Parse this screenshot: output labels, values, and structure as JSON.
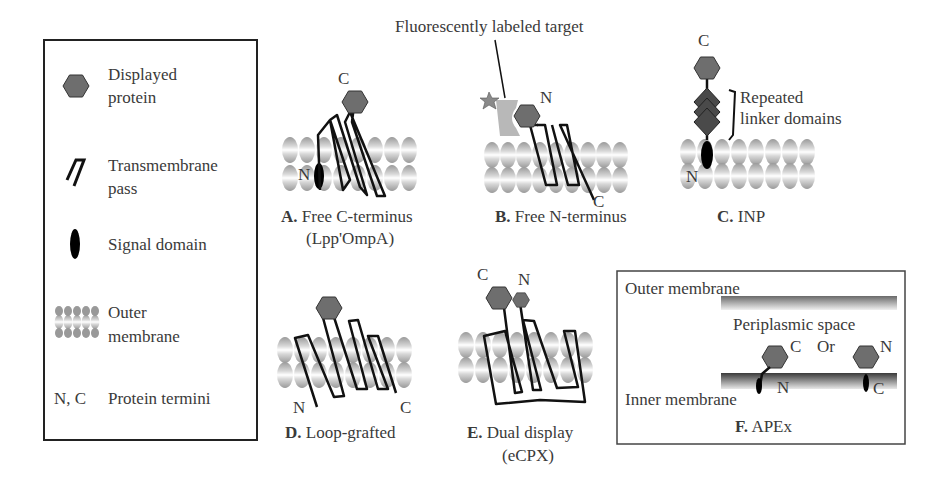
{
  "legend": {
    "items": [
      {
        "icon": "hexagon-icon",
        "line1": "Displayed",
        "line2": "protein"
      },
      {
        "icon": "transmembrane-pass-icon",
        "line1": "Transmembrane",
        "line2": "pass"
      },
      {
        "icon": "signal-domain-icon",
        "line1": "Signal domain",
        "line2": ""
      },
      {
        "icon": "outer-membrane-icon",
        "line1": "Outer",
        "line2": "membrane"
      },
      {
        "icon": "termini-symbol",
        "symbol": "N, C",
        "line1": "Protein termini",
        "line2": ""
      }
    ]
  },
  "panels": {
    "A": {
      "letter": "A.",
      "title": "Free C-terminus",
      "subtitle": "(Lpp'OmpA)",
      "n": "N",
      "c": "C"
    },
    "B": {
      "letter": "B.",
      "title": "Free N-terminus",
      "n": "N",
      "c": "C",
      "annotation": "Fluorescently labeled target"
    },
    "C": {
      "letter": "C.",
      "title": "INP",
      "n": "N",
      "c": "C",
      "annotation_line1": "Repeated",
      "annotation_line2": "linker domains"
    },
    "D": {
      "letter": "D.",
      "title": "Loop-grafted",
      "n": "N",
      "c": "C"
    },
    "E": {
      "letter": "E.",
      "title": "Dual display",
      "subtitle": "(eCPX)",
      "n": "N",
      "c": "C"
    },
    "F": {
      "letter": "F.",
      "title": "APEx",
      "outer": "Outer membrane",
      "periplasm": "Periplasmic space",
      "inner": "Inner membrane",
      "or": "Or",
      "left_c": "C",
      "left_n": "N",
      "right_n": "N",
      "right_c": "C"
    }
  },
  "colors": {
    "hexagon": "#6e6e6e",
    "linker": "#4a4a4a",
    "target": "#b8b8b8",
    "star": "#8a8a8a",
    "line": "#111111"
  }
}
